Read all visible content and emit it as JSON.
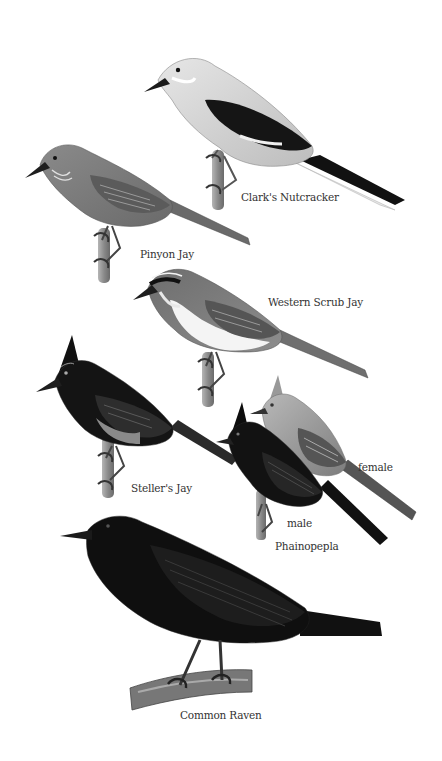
{
  "plate": {
    "background": "#ffffff",
    "palette": {
      "light_gray": "#cfcfcf",
      "mid_gray": "#8c8c8c",
      "dark_gray": "#4a4a4a",
      "black": "#111111",
      "branch": "#9a9a9a",
      "label_text": "#333333"
    },
    "birds": [
      {
        "id": "clarks-nutcracker",
        "label": "Clark's Nutcracker"
      },
      {
        "id": "pinyon-jay",
        "label": "Pinyon Jay"
      },
      {
        "id": "western-scrub-jay",
        "label": "Western Scrub Jay"
      },
      {
        "id": "stellers-jay",
        "label": "Steller's Jay"
      },
      {
        "id": "phainopepla",
        "label": "Phainopepla",
        "variants": [
          {
            "label": "male"
          },
          {
            "label": "female"
          }
        ]
      },
      {
        "id": "common-raven",
        "label": "Common Raven"
      }
    ]
  }
}
